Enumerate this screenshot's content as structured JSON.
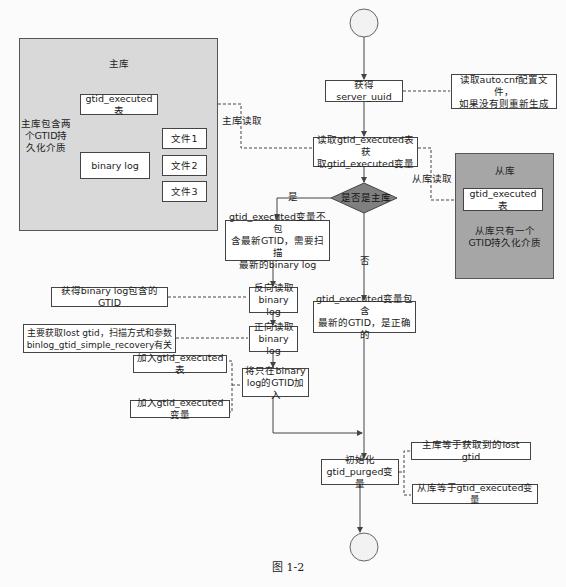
{
  "caption": "图 1-2",
  "master_panel": {
    "title": "主库",
    "brace_label": "主库包含两\n个GTID持\n久化介质",
    "table_box": "gtid_executed表",
    "binlog_box": "binary log",
    "files": [
      "文件1",
      "文件2",
      "文件3"
    ]
  },
  "slave_panel": {
    "title": "从库",
    "table_box": "gtid_executed表",
    "note": "从库只有一个\nGTID持久化介质"
  },
  "flow": {
    "get_uuid": "获得server_uuid",
    "uuid_note": "读取auto.cnf配置文件，\n如果没有则重新生成",
    "read_table": "读取gtid_executed表获\n取gtid_executed变量",
    "master_read_label": "主库读取",
    "slave_read_label": "从库读取",
    "decision": "是否是主库",
    "yes_label": "是",
    "no_label": "否",
    "yes_branch": "gtid_executed变量不包\n含最新GTID，需要扫描\n最新的binary log",
    "no_branch": "gtid_executed变量包含\n最新的GTID，是正确的",
    "reverse_read": "反向读取\nbinary log",
    "reverse_note": "获得binary log包含的GTID",
    "forward_read": "正向读取\nbinary log",
    "forward_note": "主要获取lost gtid，扫描方式和参数\nbinlog_gtid_simple_recovery有关",
    "add_gtid": "将只在binary\nlog的GTID加入",
    "add_table_note": "加入gtid_executed表",
    "add_var_note": "加入gtid_executed变量",
    "init_purged": "初始化\ngtid_purged变量",
    "purged_master_note": "主库等于获取到的lost gtid",
    "purged_slave_note": "从库等于gtid_executed变量"
  },
  "colors": {
    "master_panel_bg": "#d9d9d9",
    "slave_panel_bg": "#a6a6a6",
    "decision_fill": "#7f7f7f",
    "circle_fill": "#f2f2f2",
    "line": "#444444"
  }
}
